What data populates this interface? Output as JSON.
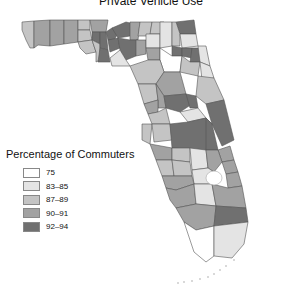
{
  "title": "Private Vehicle Use",
  "legend": {
    "title": "Percentage of Commuters",
    "items": [
      {
        "label": "75",
        "color": "#ffffff"
      },
      {
        "label": "83–85",
        "color": "#e4e4e4"
      },
      {
        "label": "87–89",
        "color": "#c4c4c4"
      },
      {
        "label": "90–91",
        "color": "#a2a2a2"
      },
      {
        "label": "92–94",
        "color": "#707070"
      }
    ]
  },
  "map": {
    "region": "Florida",
    "unit": "county"
  }
}
